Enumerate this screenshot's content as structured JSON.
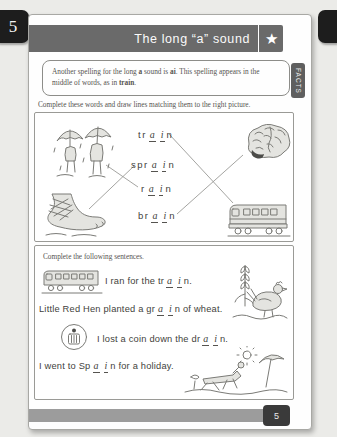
{
  "tabs": {
    "left_page_tab": "5",
    "footer_page_tab": "5"
  },
  "header": {
    "title": "The long “a” sound",
    "star_icon": "★"
  },
  "facts": {
    "tab_label": "FACTS",
    "seg1": "Another spelling for the long ",
    "bold1": "a",
    "seg2": " sound is ",
    "bold2": "ai",
    "seg3": ". This spelling appears in the middle of words, as in ",
    "bold3": "train",
    "seg4": "."
  },
  "matching": {
    "instruction": "Complete these words and draw lines matching them to the right picture.",
    "words": [
      {
        "prefix": "tr",
        "a1": "a",
        "a2": "i",
        "suffix": "n"
      },
      {
        "prefix": "spr",
        "a1": "a",
        "a2": "i",
        "suffix": "n"
      },
      {
        "prefix": "r",
        "a1": "a",
        "a2": "i",
        "suffix": "n"
      },
      {
        "prefix": "br",
        "a1": "a",
        "a2": "i",
        "suffix": "n"
      }
    ],
    "pictures": [
      "rain children with umbrellas",
      "brain",
      "sprained bandaged foot",
      "train"
    ]
  },
  "sentences": {
    "instruction": "Complete the following sentences.",
    "items": [
      {
        "pre": "I ran for the tr",
        "a1": "a",
        "a2": "i",
        "post": "n."
      },
      {
        "pre": "Little Red Hen planted a gr",
        "a1": "a",
        "a2": "i",
        "post": "n of wheat."
      },
      {
        "pre": "I lost a coin down the dr",
        "a1": "a",
        "a2": "i",
        "post": "n."
      },
      {
        "pre": "I went to Sp",
        "a1": "a",
        "a2": "i",
        "post": "n for a holiday."
      }
    ]
  },
  "colors": {
    "header_bar": "#6a6a6a",
    "footer_bar": "#9c9c9c",
    "page_tab": "#1d1d1d",
    "facts_tab": "#5f5f5f",
    "match_line": "#9a9a96"
  }
}
